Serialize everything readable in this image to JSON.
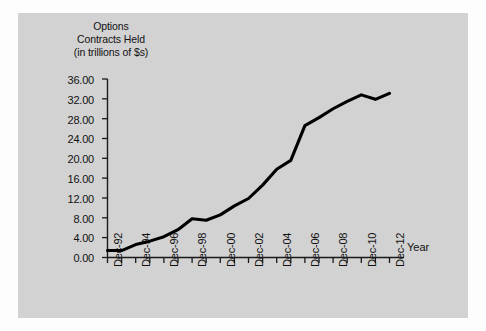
{
  "chart_data": {
    "type": "line",
    "title": "Options Contracts Held (in trillions of $s)",
    "title_lines": [
      "Options",
      "Contracts Held",
      "(in trillions of $s)"
    ],
    "xlabel": "Year",
    "ylabel": "Options Contracts Held (in trillions of $s)",
    "ylim": [
      0,
      36
    ],
    "ytick_labels": [
      "36.00",
      "32.00",
      "28.00",
      "24.00",
      "20.00",
      "16.00",
      "12.00",
      "8.00",
      "4.00",
      "0.00"
    ],
    "ytick_values": [
      36,
      32,
      28,
      24,
      20,
      16,
      12,
      8,
      4,
      0
    ],
    "grid": false,
    "legend": "none",
    "line_color": "#000000",
    "line_width": 3,
    "background_color": "#d2d2d2",
    "x": [
      "Dec-92",
      "Dec-93",
      "Dec-94",
      "Dec-95",
      "Dec-96",
      "Dec-97",
      "Dec-98",
      "Dec-99",
      "Dec-00",
      "Dec-01",
      "Dec-02",
      "Dec-03",
      "Dec-04",
      "Dec-05",
      "Dec-06",
      "Dec-07",
      "Dec-08",
      "Dec-09",
      "Dec-10",
      "Dec-11",
      "Dec-12"
    ],
    "xtick_labels_shown": [
      "Dec-92",
      "Dec-94",
      "Dec-96",
      "Dec-98",
      "Dec-00",
      "Dec-02",
      "Dec-04",
      "Dec-06",
      "Dec-08",
      "Dec-10",
      "Dec-12"
    ],
    "values": [
      1.4,
      1.4,
      2.6,
      3.3,
      4.2,
      5.6,
      7.8,
      7.5,
      8.6,
      10.4,
      11.9,
      14.6,
      17.8,
      19.6,
      26.6,
      28.2,
      30.0,
      31.5,
      32.8,
      31.9,
      33.1
    ]
  }
}
